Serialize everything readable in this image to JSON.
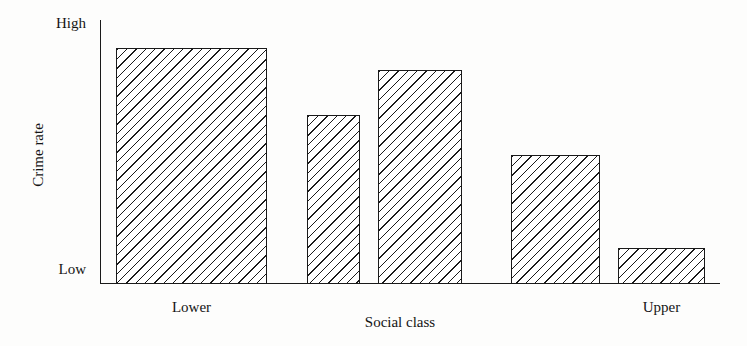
{
  "chart_data": {
    "type": "bar",
    "title": "",
    "subtitle": "",
    "xlabel": "Social class",
    "ylabel": "Crime rate",
    "categories": [
      "Lower",
      "",
      "",
      "",
      "Upper"
    ],
    "visible_category_labels": [
      "Lower",
      "Upper"
    ],
    "values": [
      89,
      64,
      81,
      49,
      13
    ],
    "ylim": [
      0,
      100
    ],
    "y_tick_labels": [
      "Low",
      "High"
    ],
    "y_tick_values": [
      0,
      100
    ],
    "grid": false,
    "legend": null,
    "annotations": [],
    "bar_fill": "diagonal-hatch",
    "bar_outline_color": "#1a1a1a",
    "background_color": "#fdfdfc",
    "bars": [
      {
        "index": 0,
        "label": "Lower",
        "value": 89,
        "left_px": 116,
        "right_px": 267,
        "top_px": 48
      },
      {
        "index": 1,
        "label": "",
        "value": 64,
        "left_px": 307,
        "right_px": 360,
        "top_px": 115
      },
      {
        "index": 2,
        "label": "",
        "value": 81,
        "left_px": 378,
        "right_px": 462,
        "top_px": 70
      },
      {
        "index": 3,
        "label": "",
        "value": 49,
        "left_px": 511,
        "right_px": 600,
        "top_px": 155
      },
      {
        "index": 4,
        "label": "Upper",
        "value": 13,
        "left_px": 618,
        "right_px": 705,
        "top_px": 248
      }
    ]
  },
  "axes": {
    "y_top_label": "High",
    "y_bottom_label": "Low",
    "y_title": "Crime rate",
    "x_title": "Social class"
  },
  "category_labels": {
    "first": "Lower",
    "last": "Upper"
  }
}
